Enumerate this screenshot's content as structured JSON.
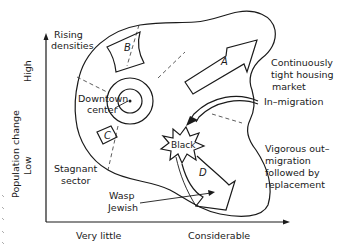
{
  "diagram": {
    "axes": {
      "y_label": "Population change",
      "y_high": "High",
      "y_low": "Low",
      "x_low": "Very little",
      "x_high": "Considerable"
    },
    "regions": {
      "a": "A",
      "b": "B",
      "c": "C",
      "d": "D"
    },
    "labels": {
      "rising_line1": "Rising",
      "rising_line2": "densities",
      "downtown_line1": "Downtown",
      "downtown_line2": "center",
      "tight_line1": "Continuously",
      "tight_line2": "tight housing",
      "tight_line3": "market",
      "in_migration": "In–migration",
      "vigorous_line1": "Vigorous out–",
      "vigorous_line2": "migration",
      "vigorous_line3": "followed by",
      "vigorous_line4": "replacement",
      "stagnant_line1": "Stagnant",
      "stagnant_line2": "sector",
      "wasp_line1": "Wasp",
      "wasp_line2": "Jewish",
      "black": "Black"
    }
  }
}
